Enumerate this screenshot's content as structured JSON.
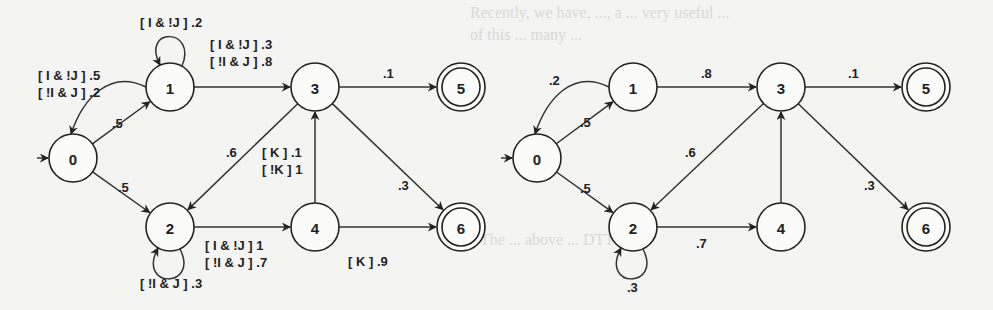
{
  "background_bleed_text": [
    "Recently, we have, ..., a ... very useful ...",
    "of this ... many ...",
    "The ... above ... DTTCs ..."
  ],
  "diagrams": [
    {
      "id": "left",
      "nodes": [
        {
          "id": "0",
          "label": "0",
          "final": false,
          "initial": true
        },
        {
          "id": "1",
          "label": "1",
          "final": false
        },
        {
          "id": "2",
          "label": "2",
          "final": false
        },
        {
          "id": "3",
          "label": "3",
          "final": false
        },
        {
          "id": "4",
          "label": "4",
          "final": false
        },
        {
          "id": "5",
          "label": "5",
          "final": true
        },
        {
          "id": "6",
          "label": "6",
          "final": true
        }
      ],
      "edges": [
        {
          "from": "0",
          "to": "1",
          "labels": [
            ".5"
          ]
        },
        {
          "from": "0",
          "to": "2",
          "labels": [
            ".5"
          ]
        },
        {
          "from": "1",
          "to": "0",
          "labels": [
            "[ I & !J ] .5",
            "[ !I & J ] .2"
          ]
        },
        {
          "from": "1",
          "to": "1",
          "labels": [
            "[ I & !J ] .2"
          ]
        },
        {
          "from": "1",
          "to": "3",
          "labels": [
            "[ I & !J ] .3",
            "[ !I & J ] .8"
          ]
        },
        {
          "from": "2",
          "to": "2",
          "labels": [
            "[ !I & J ]  .3"
          ]
        },
        {
          "from": "2",
          "to": "4",
          "labels": [
            "[ I & !J ] 1",
            "[ !I & J ] .7"
          ]
        },
        {
          "from": "3",
          "to": "2",
          "labels": [
            ".6"
          ]
        },
        {
          "from": "3",
          "to": "5",
          "labels": [
            ".1"
          ]
        },
        {
          "from": "3",
          "to": "6",
          "labels": [
            ".3"
          ]
        },
        {
          "from": "4",
          "to": "3",
          "labels": [
            "[ K ] .1",
            "[ !K ] 1"
          ]
        },
        {
          "from": "4",
          "to": "6",
          "labels": [
            "[ K ] .9"
          ]
        }
      ]
    },
    {
      "id": "right",
      "nodes": [
        {
          "id": "0",
          "label": "0",
          "final": false,
          "initial": true
        },
        {
          "id": "1",
          "label": "1",
          "final": false
        },
        {
          "id": "2",
          "label": "2",
          "final": false
        },
        {
          "id": "3",
          "label": "3",
          "final": false
        },
        {
          "id": "4",
          "label": "4",
          "final": false
        },
        {
          "id": "5",
          "label": "5",
          "final": true
        },
        {
          "id": "6",
          "label": "6",
          "final": true
        }
      ],
      "edges": [
        {
          "from": "0",
          "to": "1",
          "labels": [
            ".5"
          ]
        },
        {
          "from": "0",
          "to": "2",
          "labels": [
            ".5"
          ]
        },
        {
          "from": "1",
          "to": "0",
          "labels": [
            ".2"
          ]
        },
        {
          "from": "1",
          "to": "3",
          "labels": [
            ".8"
          ]
        },
        {
          "from": "2",
          "to": "2",
          "labels": [
            ".3"
          ]
        },
        {
          "from": "2",
          "to": "4",
          "labels": [
            ".7"
          ]
        },
        {
          "from": "3",
          "to": "2",
          "labels": [
            ".6"
          ]
        },
        {
          "from": "3",
          "to": "5",
          "labels": [
            ".1"
          ]
        },
        {
          "from": "3",
          "to": "6",
          "labels": [
            ".3"
          ]
        },
        {
          "from": "4",
          "to": "3",
          "labels": []
        }
      ]
    }
  ]
}
